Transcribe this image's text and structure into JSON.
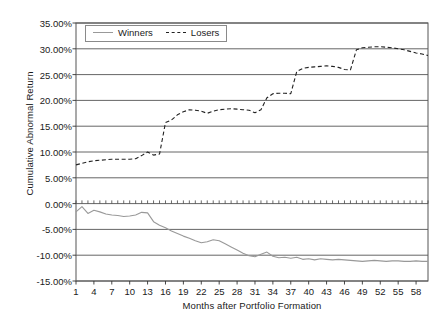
{
  "chart_data": {
    "type": "line",
    "title": "",
    "xlabel": "Months after Portfolio Formation",
    "ylabel": "Cumulative Abnormal Return",
    "xlim": [
      1,
      60
    ],
    "ylim": [
      -15,
      35
    ],
    "ytick_labels": [
      "35.00%",
      "30.00%",
      "25.00%",
      "20.00%",
      "15.00%",
      "10.00%",
      "5.00%",
      "0.00%",
      "-5.00%",
      "-10.00%",
      "-15.00%"
    ],
    "ytick_values": [
      35,
      30,
      25,
      20,
      15,
      10,
      5,
      0,
      -5,
      -10,
      -15
    ],
    "xtick_labels": [
      "1",
      "4",
      "7",
      "10",
      "13",
      "16",
      "19",
      "22",
      "25",
      "28",
      "31",
      "34",
      "37",
      "40",
      "43",
      "46",
      "49",
      "52",
      "55",
      "58"
    ],
    "xtick_values": [
      1,
      4,
      7,
      10,
      13,
      16,
      19,
      22,
      25,
      28,
      31,
      34,
      37,
      40,
      43,
      46,
      49,
      52,
      55,
      58
    ],
    "grid": "horizontal",
    "legend_position": "top-left-inside",
    "x": [
      1,
      2,
      3,
      4,
      5,
      6,
      7,
      8,
      9,
      10,
      11,
      12,
      13,
      14,
      15,
      16,
      17,
      18,
      19,
      20,
      21,
      22,
      23,
      24,
      25,
      26,
      27,
      28,
      29,
      30,
      31,
      32,
      33,
      34,
      35,
      36,
      37,
      38,
      39,
      40,
      41,
      42,
      43,
      44,
      45,
      46,
      47,
      48,
      49,
      50,
      51,
      52,
      53,
      54,
      55,
      56,
      57,
      58,
      59,
      60
    ],
    "series": [
      {
        "name": "Winners",
        "color": "#999999",
        "style": "solid",
        "values": [
          -1.6,
          -0.6,
          -1.9,
          -1.3,
          -1.6,
          -2.0,
          -2.2,
          -2.3,
          -2.5,
          -2.4,
          -2.2,
          -1.7,
          -1.8,
          -3.5,
          -4.2,
          -4.7,
          -5.3,
          -5.8,
          -6.3,
          -6.7,
          -7.2,
          -7.6,
          -7.4,
          -7.0,
          -7.2,
          -7.8,
          -8.4,
          -9.0,
          -9.6,
          -10.1,
          -10.3,
          -9.8,
          -9.4,
          -10.2,
          -10.5,
          -10.4,
          -10.6,
          -10.4,
          -10.8,
          -10.7,
          -10.9,
          -10.7,
          -10.8,
          -10.9,
          -10.8,
          -10.9,
          -11.0,
          -11.1,
          -11.2,
          -11.1,
          -11.0,
          -11.1,
          -11.2,
          -11.1,
          -11.1,
          -11.2,
          -11.2,
          -11.1,
          -11.2,
          -11.2
        ]
      },
      {
        "name": "Losers",
        "color": "#222222",
        "style": "dashed",
        "values": [
          7.5,
          7.8,
          8.1,
          8.3,
          8.4,
          8.5,
          8.6,
          8.6,
          8.6,
          8.6,
          8.7,
          9.3,
          10.0,
          9.4,
          9.6,
          15.7,
          16.2,
          17.2,
          17.8,
          18.2,
          18.1,
          17.9,
          17.5,
          17.9,
          18.2,
          18.3,
          18.4,
          18.3,
          18.2,
          18.1,
          17.6,
          18.2,
          20.5,
          21.3,
          21.4,
          21.4,
          21.3,
          25.6,
          26.2,
          26.4,
          26.5,
          26.6,
          26.7,
          26.6,
          26.4,
          26.0,
          25.9,
          29.8,
          30.2,
          30.3,
          30.4,
          30.4,
          30.3,
          30.2,
          30.0,
          29.8,
          29.5,
          29.2,
          29.0,
          28.7
        ]
      }
    ]
  },
  "legend": {
    "items": [
      {
        "label": "Winners"
      },
      {
        "label": "Losers"
      }
    ]
  }
}
